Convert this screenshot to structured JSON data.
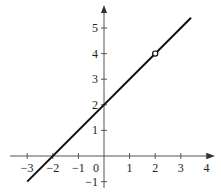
{
  "chart_data": {
    "type": "line",
    "title": "",
    "xlabel": "",
    "ylabel": "",
    "function": "y = x + 2, x ≠ 2",
    "series": [
      {
        "name": "y = x + 2",
        "x": [
          -3,
          3.4
        ],
        "y": [
          -1,
          5.4
        ]
      }
    ],
    "open_points": [
      {
        "x": 2,
        "y": 4
      }
    ],
    "xlim": [
      -3.5,
      4.3
    ],
    "ylim": [
      -1.2,
      5.9
    ],
    "x_ticks": [
      -3,
      -2,
      -1,
      0,
      1,
      2,
      3,
      4
    ],
    "y_ticks": [
      -1,
      1,
      2,
      3,
      4,
      5
    ],
    "x_tick_labels": [
      "−3",
      "−2",
      "−1",
      "0",
      "1",
      "2",
      "3",
      "4"
    ],
    "y_tick_labels": [
      "−1",
      "1",
      "2",
      "3",
      "4",
      "5"
    ],
    "grid": false,
    "legend": null
  }
}
